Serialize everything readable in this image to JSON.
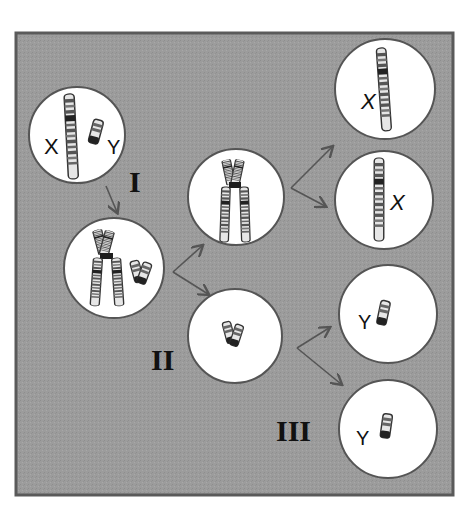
{
  "diagram": {
    "title": "",
    "colors": {
      "background": "#ffffff",
      "panel": "#9a9a9a",
      "panel_border": "#5a5a5a",
      "cell_fill": "#ffffff",
      "cell_stroke": "#555555",
      "arrow": "#555555",
      "chromosome_dark": "#333333",
      "chromosome_light": "#d8d8d8",
      "centromere": "#1e1e1e"
    },
    "stage_labels": {
      "stage_1": "I",
      "stage_2": "II",
      "stage_3": "III"
    },
    "cells": [
      {
        "id": "parent",
        "labels": [
          "X",
          "Y"
        ],
        "content": "unreplicated X and Y chromosomes"
      },
      {
        "id": "replicated",
        "labels": [],
        "content": "replicated X and Y (sister chromatids)"
      },
      {
        "id": "meiosis1-x",
        "labels": [],
        "content": "replicated X chromosome"
      },
      {
        "id": "meiosis1-y",
        "labels": [],
        "content": "replicated Y chromosome"
      },
      {
        "id": "gamete-x1",
        "labels": [
          "X"
        ],
        "content": "single X chromatid"
      },
      {
        "id": "gamete-x2",
        "labels": [
          "X"
        ],
        "content": "single X chromatid"
      },
      {
        "id": "gamete-y1",
        "labels": [
          "Y"
        ],
        "content": "single Y chromatid"
      },
      {
        "id": "gamete-y2",
        "labels": [
          "Y"
        ],
        "content": "single Y chromatid"
      }
    ],
    "text": {
      "parent_x": "X",
      "parent_y": "Y",
      "gamete_x1": "X",
      "gamete_x2": "X",
      "gamete_y1": "Y",
      "gamete_y2": "Y"
    }
  }
}
